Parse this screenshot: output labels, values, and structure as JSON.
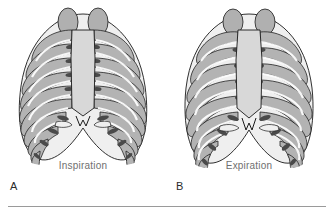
{
  "figure": {
    "type": "anatomical-illustration",
    "background_color": "#ffffff",
    "rule_color": "#9a9a9a"
  },
  "panels": [
    {
      "letter": "A",
      "caption": "Inspiration",
      "description": "Rib cage expanded, ribs elevated and more horizontal",
      "rib_pair_count": 12,
      "colors": {
        "outline": "#1a1a1a",
        "rib_fill": "#b4b4b4",
        "rib_highlight": "#f2f2f2",
        "sternum_fill": "#d8d8d8",
        "apex_fill": "#b0b0b0",
        "cartilage_fill": "#8f8f8f"
      }
    },
    {
      "letter": "B",
      "caption": "Expiration",
      "description": "Rib cage contracted, ribs depressed and more downward sloping",
      "rib_pair_count": 12,
      "colors": {
        "outline": "#1a1a1a",
        "rib_fill": "#b4b4b4",
        "rib_highlight": "#f2f2f2",
        "sternum_fill": "#d8d8d8",
        "apex_fill": "#b0b0b0",
        "cartilage_fill": "#8f8f8f"
      }
    }
  ],
  "labels": {
    "caption_color": "#6f6f6f",
    "letter_color": "#2b2b2b"
  }
}
